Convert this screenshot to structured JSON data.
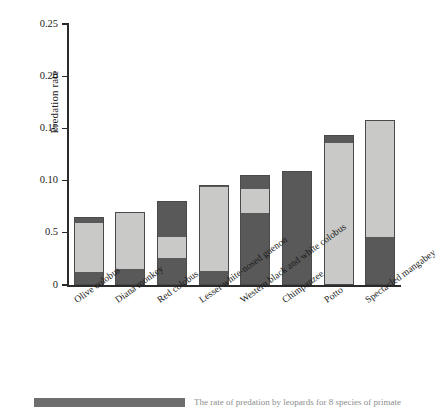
{
  "chart_data": {
    "type": "bar",
    "stacked": true,
    "title": "",
    "xlabel": "",
    "ylabel": "Predation rate",
    "ylim": [
      0,
      0.25
    ],
    "ytick_labels": [
      "0",
      "0.5",
      "0.10",
      "0.15",
      "0.20",
      "0.25"
    ],
    "ytick_values": [
      0,
      0.05,
      0.1,
      0.15,
      0.2,
      0.25
    ],
    "grid": false,
    "legend_position": "none",
    "categories": [
      "Olive colobus",
      "Diana monkey",
      "Red colobus",
      "Lesser white-nosed guenon",
      "Western black and white colobus",
      "Chimpanzee",
      "Potto",
      "Spectacled mangabey"
    ],
    "series": [
      {
        "name": "dark-lower",
        "color": "#595959",
        "values": [
          0.012,
          0.015,
          0.026,
          0.013,
          0.069,
          0.109,
          0.0,
          0.046
        ]
      },
      {
        "name": "light-middle",
        "color": "#c9c9c7",
        "values": [
          0.047,
          0.055,
          0.02,
          0.081,
          0.023,
          0.0,
          0.136,
          0.112
        ]
      },
      {
        "name": "dark-upper",
        "color": "#595959",
        "values": [
          0.006,
          0.0,
          0.034,
          0.002,
          0.013,
          0.0,
          0.008,
          0.0
        ]
      }
    ],
    "totals": [
      0.065,
      0.07,
      0.08,
      0.096,
      0.105,
      0.109,
      0.144,
      0.158
    ]
  },
  "axis": {
    "y_title": "Predation rate"
  },
  "caption": {
    "swatch_label": "",
    "text": "The rate of predation by leopards for 8 species of primate"
  }
}
